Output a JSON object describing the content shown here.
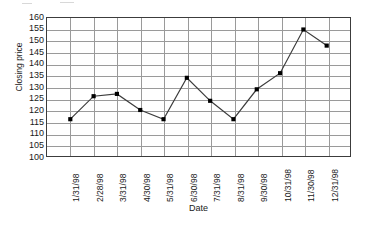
{
  "chart_data": {
    "type": "line",
    "title": "",
    "xlabel": "Date",
    "ylabel": "Closing price",
    "categories": [
      "1/31/98",
      "2/28/98",
      "3/31/98",
      "4/30/98",
      "5/31/98",
      "6/30/98",
      "7/31/98",
      "8/31/98",
      "9/30/98",
      "10/31/98",
      "11/30/98",
      "12/31/98"
    ],
    "values": [
      116,
      126,
      127,
      120,
      116,
      134,
      124,
      116,
      129,
      136,
      155,
      148
    ],
    "series": [
      {
        "name": "Closing price",
        "values": [
          116,
          126,
          127,
          120,
          116,
          134,
          124,
          116,
          129,
          136,
          155,
          148
        ]
      }
    ],
    "ylim": [
      100,
      160
    ],
    "ytick_step": 5,
    "yticks": [
      160,
      155,
      150,
      145,
      140,
      135,
      130,
      125,
      120,
      115,
      110,
      105,
      100
    ],
    "grid": "both",
    "legend": "none",
    "marker": "filled-square",
    "line_color": "#3c3c3c",
    "marker_color": "#000000",
    "grid_color": "#9a9a9a",
    "frame_color": "#3c3c3c",
    "background": "#ffffff"
  }
}
